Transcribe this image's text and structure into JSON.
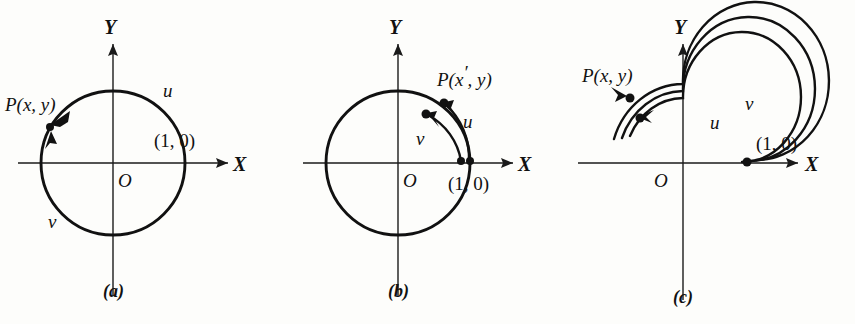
{
  "figure": {
    "background_color": "#fdfdfb",
    "ink_color": "#111111",
    "panel_count": 3
  },
  "panels": [
    {
      "id": "a",
      "caption": "(a)",
      "axis_x_label": "X",
      "axis_y_label": "Y",
      "origin_label": "O",
      "point_label": "P(x, y)",
      "point_prime": "",
      "coord_label": "(1, 0)",
      "coord_position": "above-axis",
      "path_u_label": "u",
      "path_v_label": "v",
      "description": "Single unit circle; two arcs u and v meet at point P in the second quadrant",
      "circle": {
        "cx": 113,
        "cy": 163,
        "r": 72
      },
      "arc_count": 1,
      "winding": 1
    },
    {
      "id": "b",
      "caption": "(b)",
      "axis_x_label": "X",
      "axis_y_label": "Y",
      "origin_label": "O",
      "point_label": "P(x",
      "point_prime": "′",
      "point_label_tail": ", y)",
      "coord_label": "(1, 0)",
      "coord_position": "below-axis",
      "path_u_label": "u",
      "path_v_label": "v",
      "description": "Unit circle with two short arcs u and v rising from (1,0) into the first quadrant",
      "circle": {
        "cx": 398,
        "cy": 163,
        "r": 72
      },
      "arc_count": 2,
      "winding": 1
    },
    {
      "id": "c",
      "caption": "(c)",
      "axis_x_label": "X",
      "axis_y_label": "Y",
      "origin_label": "O",
      "point_label": "P(x, y)",
      "point_prime": "",
      "coord_label": "(1, 0)",
      "coord_position": "above-axis",
      "path_u_label": "u",
      "path_v_label": "v",
      "description": "Spiral of three concentric turns; u inner and v outer, both starting at (1,0)",
      "circle": {
        "cx": 683,
        "cy": 163,
        "r": 72
      },
      "arc_count": 3,
      "winding": 2
    }
  ]
}
